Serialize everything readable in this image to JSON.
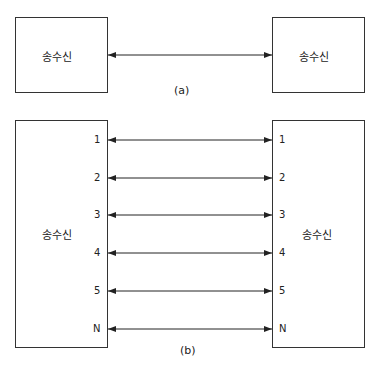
{
  "diagram_a": {
    "caption": "(a)",
    "left_node": {
      "label": "송수신"
    },
    "right_node": {
      "label": "송수신"
    },
    "link": {
      "type": "bidirectional"
    }
  },
  "diagram_b": {
    "caption": "(b)",
    "left_node": {
      "label": "송수신"
    },
    "right_node": {
      "label": "송수신"
    },
    "channels": [
      {
        "label": "1"
      },
      {
        "label": "2"
      },
      {
        "label": "3"
      },
      {
        "label": "4"
      },
      {
        "label": "5"
      },
      {
        "label": "N"
      }
    ]
  }
}
